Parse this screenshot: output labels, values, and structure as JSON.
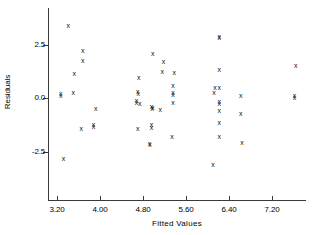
{
  "chart_data": {
    "type": "scatter",
    "title": "",
    "xlabel": "Fitted Values",
    "ylabel": "Residuals",
    "marker": "x",
    "marker_color": "#111111",
    "axis_color": "#3a3a3a",
    "grid": false,
    "legend": null,
    "xlim": [
      3.05,
      7.85
    ],
    "ylim": [
      -3.55,
      3.85
    ],
    "xticks": [
      3.2,
      4.0,
      4.8,
      5.6,
      6.4,
      7.2
    ],
    "xtick_labels": [
      "3.20",
      "4.00",
      "4.80",
      "5.60",
      "6.40",
      "7.20"
    ],
    "yticks": [
      2.5,
      0.0,
      -2.5
    ],
    "ytick_labels": [
      "2.5",
      "0.0",
      "-2.5"
    ],
    "n_points": 62,
    "points": [
      {
        "x": 3.41,
        "y": 3.42
      },
      {
        "x": 3.68,
        "y": 2.26
      },
      {
        "x": 3.68,
        "y": 1.78
      },
      {
        "x": 3.52,
        "y": 1.18
      },
      {
        "x": 3.27,
        "y": 0.22
      },
      {
        "x": 3.27,
        "y": 0.14
      },
      {
        "x": 3.5,
        "y": 0.28
      },
      {
        "x": 3.92,
        "y": -0.48
      },
      {
        "x": 3.65,
        "y": -1.42
      },
      {
        "x": 3.88,
        "y": -1.22
      },
      {
        "x": 3.88,
        "y": -1.32
      },
      {
        "x": 3.32,
        "y": -2.82
      },
      {
        "x": 4.72,
        "y": 1.0
      },
      {
        "x": 4.7,
        "y": 0.32
      },
      {
        "x": 4.71,
        "y": 0.22
      },
      {
        "x": 4.68,
        "y": -0.08
      },
      {
        "x": 4.68,
        "y": -0.18
      },
      {
        "x": 4.74,
        "y": -0.22
      },
      {
        "x": 4.7,
        "y": -1.38
      },
      {
        "x": 4.98,
        "y": 2.12
      },
      {
        "x": 4.96,
        "y": -0.38
      },
      {
        "x": 4.98,
        "y": -0.42
      },
      {
        "x": 4.97,
        "y": -0.48
      },
      {
        "x": 4.96,
        "y": -1.22
      },
      {
        "x": 4.96,
        "y": -1.34
      },
      {
        "x": 4.92,
        "y": -2.08
      },
      {
        "x": 4.93,
        "y": -2.16
      },
      {
        "x": 5.18,
        "y": 1.72
      },
      {
        "x": 5.16,
        "y": 1.28
      },
      {
        "x": 5.12,
        "y": -0.52
      },
      {
        "x": 5.38,
        "y": 1.22
      },
      {
        "x": 5.36,
        "y": 0.62
      },
      {
        "x": 5.36,
        "y": 0.26
      },
      {
        "x": 5.36,
        "y": 0.18
      },
      {
        "x": 5.36,
        "y": -0.18
      },
      {
        "x": 5.34,
        "y": -1.78
      },
      {
        "x": 6.14,
        "y": 0.52
      },
      {
        "x": 6.12,
        "y": 0.26
      },
      {
        "x": 6.1,
        "y": -3.08
      },
      {
        "x": 6.22,
        "y": 2.92
      },
      {
        "x": 6.22,
        "y": 2.84
      },
      {
        "x": 6.22,
        "y": 1.34
      },
      {
        "x": 6.22,
        "y": 0.52
      },
      {
        "x": 6.22,
        "y": -0.14
      },
      {
        "x": 6.22,
        "y": -0.24
      },
      {
        "x": 6.22,
        "y": -0.58
      },
      {
        "x": 6.22,
        "y": -1.12
      },
      {
        "x": 6.22,
        "y": -1.76
      },
      {
        "x": 6.62,
        "y": 0.14
      },
      {
        "x": 6.62,
        "y": -0.72
      },
      {
        "x": 6.64,
        "y": -2.06
      },
      {
        "x": 7.64,
        "y": 1.54
      },
      {
        "x": 7.62,
        "y": 0.16
      },
      {
        "x": 7.62,
        "y": 0.06
      }
    ]
  },
  "axis": {
    "y_title": "Residuals",
    "x_title": "Fitted  Values"
  }
}
